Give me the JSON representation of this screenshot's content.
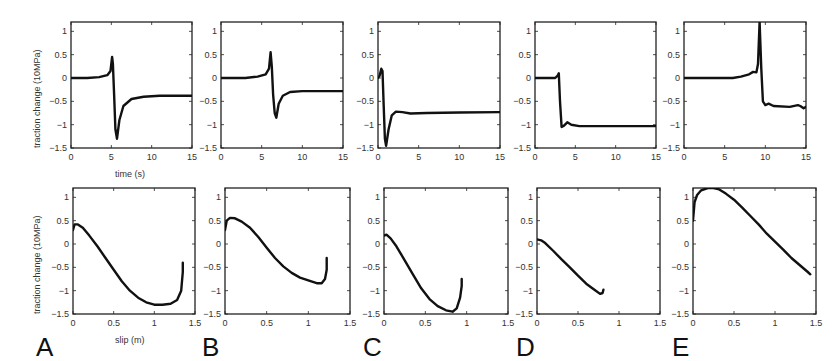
{
  "figure": {
    "ylabel": "traction change (10MPa)",
    "top_xlabel": "time (s)",
    "bottom_xlabel": "slip (m)",
    "panel_labels": [
      "A",
      "B",
      "C",
      "D",
      "E"
    ]
  },
  "chart_data": [
    {
      "type": "line",
      "panel": "A",
      "row": "top",
      "xlabel": "time (s)",
      "ylabel": "traction change (10MPa)",
      "xlim": [
        0,
        15
      ],
      "ylim": [
        -1.5,
        1.2
      ],
      "xticks": [
        0,
        5,
        10,
        15
      ],
      "yticks": [
        -1.5,
        -1,
        -0.5,
        0,
        0.5,
        1
      ],
      "x": [
        0,
        2,
        3.5,
        4.5,
        4.9,
        5.1,
        5.2,
        5.35,
        5.5,
        5.7,
        6.0,
        6.5,
        7.5,
        9,
        11,
        15
      ],
      "y": [
        0,
        0,
        0.02,
        0.06,
        0.15,
        0.45,
        0.3,
        -0.4,
        -1.1,
        -1.3,
        -0.9,
        -0.6,
        -0.45,
        -0.4,
        -0.38,
        -0.38
      ]
    },
    {
      "type": "line",
      "panel": "B",
      "row": "top",
      "xlabel": "",
      "ylabel": "",
      "xlim": [
        0,
        15
      ],
      "ylim": [
        -1.5,
        1.2
      ],
      "xticks": [
        0,
        5,
        10,
        15
      ],
      "yticks": [
        -1.5,
        -1,
        -0.5,
        0,
        0.5,
        1
      ],
      "x": [
        0,
        3,
        4.5,
        5.5,
        5.9,
        6.1,
        6.25,
        6.4,
        6.6,
        6.8,
        7.1,
        7.6,
        8.5,
        10,
        15
      ],
      "y": [
        0,
        0,
        0.03,
        0.08,
        0.2,
        0.55,
        0.25,
        -0.35,
        -0.75,
        -0.85,
        -0.55,
        -0.38,
        -0.3,
        -0.28,
        -0.28
      ]
    },
    {
      "type": "line",
      "panel": "C",
      "row": "top",
      "xlabel": "",
      "ylabel": "",
      "xlim": [
        0,
        15
      ],
      "ylim": [
        -1.5,
        1.2
      ],
      "xticks": [
        0,
        5,
        10,
        15
      ],
      "yticks": [
        -1.5,
        -1,
        -0.5,
        0,
        0.5,
        1
      ],
      "x": [
        0,
        0.2,
        0.4,
        0.55,
        0.7,
        0.85,
        1.0,
        1.3,
        1.7,
        2.2,
        3.0,
        4.0,
        6,
        10,
        15
      ],
      "y": [
        0,
        0.05,
        0.2,
        0.15,
        -0.6,
        -1.3,
        -1.45,
        -1.1,
        -0.8,
        -0.72,
        -0.73,
        -0.76,
        -0.75,
        -0.74,
        -0.73
      ]
    },
    {
      "type": "line",
      "panel": "D",
      "row": "top",
      "xlabel": "",
      "ylabel": "",
      "xlim": [
        0,
        15
      ],
      "ylim": [
        -1.5,
        1.2
      ],
      "xticks": [
        0,
        5,
        10,
        15
      ],
      "yticks": [
        -1.5,
        -1,
        -0.5,
        0,
        0.5,
        1
      ],
      "x": [
        0,
        2.5,
        2.8,
        2.95,
        3.1,
        3.3,
        3.6,
        4.0,
        4.5,
        5.5,
        8,
        15
      ],
      "y": [
        0,
        0,
        0.05,
        0.1,
        -0.5,
        -1.05,
        -1.02,
        -0.95,
        -1.0,
        -1.03,
        -1.03,
        -1.03
      ]
    },
    {
      "type": "line",
      "panel": "E",
      "row": "top",
      "xlabel": "",
      "ylabel": "",
      "xlim": [
        0,
        15
      ],
      "ylim": [
        -1.5,
        1.2
      ],
      "xticks": [
        0,
        5,
        10,
        15
      ],
      "yticks": [
        -1.5,
        -1,
        -0.5,
        0,
        0.5,
        1
      ],
      "x": [
        0,
        6,
        7,
        8,
        8.5,
        8.9,
        9.1,
        9.3,
        9.5,
        9.7,
        10.0,
        10.4,
        11,
        13,
        14,
        14.3,
        14.7,
        15
      ],
      "y": [
        0,
        0,
        0.03,
        0.08,
        0.13,
        0.12,
        0.3,
        1.2,
        0.2,
        -0.5,
        -0.58,
        -0.55,
        -0.6,
        -0.62,
        -0.58,
        -0.6,
        -0.65,
        -0.62
      ]
    },
    {
      "type": "line",
      "panel": "A",
      "row": "bottom",
      "xlabel": "slip (m)",
      "ylabel": "traction change (10MPa)",
      "xlim": [
        0,
        1.5
      ],
      "ylim": [
        -1.5,
        1.2
      ],
      "xticks": [
        0,
        0.5,
        1,
        1.5
      ],
      "yticks": [
        -1.5,
        -1,
        -0.5,
        0,
        0.5,
        1
      ],
      "x": [
        0,
        0.02,
        0.06,
        0.12,
        0.2,
        0.3,
        0.4,
        0.5,
        0.6,
        0.7,
        0.8,
        0.9,
        1.0,
        1.1,
        1.2,
        1.28,
        1.33,
        1.35,
        1.35
      ],
      "y": [
        0.3,
        0.42,
        0.42,
        0.35,
        0.18,
        -0.05,
        -0.3,
        -0.55,
        -0.8,
        -1.0,
        -1.15,
        -1.25,
        -1.3,
        -1.3,
        -1.28,
        -1.2,
        -1.0,
        -0.6,
        -0.4
      ]
    },
    {
      "type": "line",
      "panel": "B",
      "row": "bottom",
      "xlabel": "",
      "ylabel": "",
      "xlim": [
        0,
        1.5
      ],
      "ylim": [
        -1.5,
        1.2
      ],
      "xticks": [
        0,
        0.5,
        1,
        1.5
      ],
      "yticks": [
        -1.5,
        -1,
        -0.5,
        0,
        0.5,
        1
      ],
      "x": [
        0,
        0.02,
        0.06,
        0.12,
        0.2,
        0.3,
        0.4,
        0.5,
        0.6,
        0.7,
        0.8,
        0.9,
        1.0,
        1.1,
        1.16,
        1.2,
        1.22,
        1.22
      ],
      "y": [
        0.3,
        0.5,
        0.56,
        0.55,
        0.48,
        0.35,
        0.15,
        -0.08,
        -0.3,
        -0.48,
        -0.62,
        -0.72,
        -0.78,
        -0.84,
        -0.84,
        -0.75,
        -0.55,
        -0.3
      ]
    },
    {
      "type": "line",
      "panel": "C",
      "row": "bottom",
      "xlabel": "",
      "ylabel": "",
      "xlim": [
        0,
        1.5
      ],
      "ylim": [
        -1.5,
        1.2
      ],
      "xticks": [
        0,
        0.5,
        1,
        1.5
      ],
      "yticks": [
        -1.5,
        -1,
        -0.5,
        0,
        0.5,
        1
      ],
      "x": [
        0,
        0.03,
        0.08,
        0.15,
        0.25,
        0.35,
        0.45,
        0.55,
        0.65,
        0.75,
        0.83,
        0.88,
        0.92,
        0.94,
        0.94
      ],
      "y": [
        0.18,
        0.2,
        0.12,
        -0.05,
        -0.35,
        -0.65,
        -0.95,
        -1.18,
        -1.33,
        -1.42,
        -1.45,
        -1.38,
        -1.15,
        -0.9,
        -0.75
      ]
    },
    {
      "type": "line",
      "panel": "D",
      "row": "bottom",
      "xlabel": "",
      "ylabel": "",
      "xlim": [
        0,
        1.5
      ],
      "ylim": [
        -1.5,
        1.2
      ],
      "xticks": [
        0,
        0.5,
        1,
        1.5
      ],
      "yticks": [
        -1.5,
        -1,
        -0.5,
        0,
        0.5,
        1
      ],
      "x": [
        0,
        0.05,
        0.1,
        0.2,
        0.3,
        0.4,
        0.5,
        0.6,
        0.7,
        0.77,
        0.8,
        0.81
      ],
      "y": [
        0.1,
        0.08,
        0.02,
        -0.15,
        -0.33,
        -0.5,
        -0.68,
        -0.85,
        -0.98,
        -1.07,
        -1.05,
        -0.98
      ]
    },
    {
      "type": "line",
      "panel": "E",
      "row": "bottom",
      "xlabel": "",
      "ylabel": "",
      "xlim": [
        0,
        1.5
      ],
      "ylim": [
        -1.5,
        1.2
      ],
      "xticks": [
        0,
        0.5,
        1,
        1.5
      ],
      "yticks": [
        -1.5,
        -1,
        -0.5,
        0,
        0.5,
        1
      ],
      "x": [
        0,
        0.02,
        0.05,
        0.1,
        0.18,
        0.25,
        0.32,
        0.4,
        0.5,
        0.6,
        0.7,
        0.8,
        0.9,
        1.0,
        1.1,
        1.2,
        1.3,
        1.4,
        1.43
      ],
      "y": [
        0.5,
        0.9,
        1.05,
        1.15,
        1.2,
        1.2,
        1.17,
        1.08,
        0.95,
        0.78,
        0.6,
        0.42,
        0.22,
        0.05,
        -0.12,
        -0.3,
        -0.45,
        -0.6,
        -0.65
      ]
    }
  ]
}
